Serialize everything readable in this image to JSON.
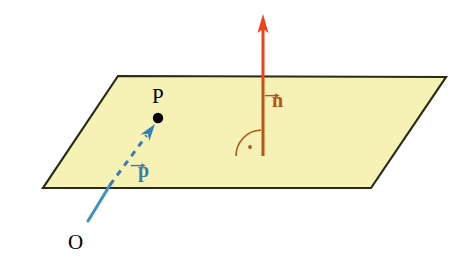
{
  "figure": {
    "background_color": "#FFFFFF"
  },
  "plane": {
    "name": "plane",
    "fill_color": "#F6F1B4",
    "edge_color": "#2B2A15",
    "edge_width": 2.2,
    "corners": [
      {
        "x": 118,
        "y": 76
      },
      {
        "x": 446,
        "y": 77
      },
      {
        "x": 371,
        "y": 188
      },
      {
        "x": 43,
        "y": 188
      }
    ]
  },
  "point": {
    "label": "P",
    "label_x": 152,
    "label_y": 86,
    "dot_x": 158,
    "dot_y": 118,
    "dot_radius": 5.2,
    "color": "#000000"
  },
  "origin": {
    "label": "O",
    "label_x": 68,
    "label_y": 232,
    "color": "#000000"
  },
  "position_vector": {
    "label": "p",
    "label_x": 138,
    "label_y": 160,
    "color_solid": "#3C8FC8",
    "color_dashed": "#3A7CA8",
    "solid_start": {
      "x": 88,
      "y": 221
    },
    "plane_crossing": {
      "x": 110,
      "y": 185
    },
    "arrow_tip": {
      "x": 155,
      "y": 124
    },
    "line_width": 3.0,
    "dash_pattern": "6 6"
  },
  "normal_vector": {
    "label": "n",
    "label_x": 272,
    "label_y": 90,
    "color_above": "#F2401A",
    "color_below": "#B5541B",
    "base": {
      "x": 263,
      "y": 156
    },
    "plane_crossing": {
      "x": 263,
      "y": 81
    },
    "arrow_tip": {
      "x": 263,
      "y": 16
    },
    "line_width": 3.0
  },
  "right_angle_mark": {
    "name": "perpendicular-arc",
    "color": "#B5541B",
    "arc_start": {
      "x": 236,
      "y": 156
    },
    "arc_end": {
      "x": 261,
      "y": 130
    },
    "arc_radius": 26,
    "dot": {
      "x": 250,
      "y": 147
    },
    "dot_radius": 1.9,
    "line_width": 1.6
  }
}
